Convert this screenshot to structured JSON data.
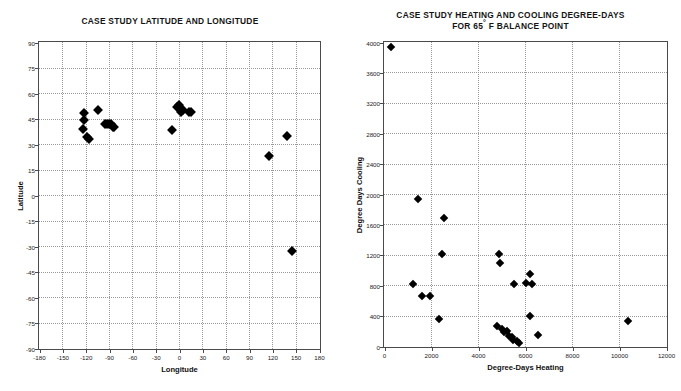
{
  "chart_data": [
    {
      "id": "latlon",
      "type": "scatter",
      "title": "CASE STUDY LATITUDE AND LONGITUDE",
      "xlabel": "Longitude",
      "ylabel": "Latitude",
      "xlim": [
        -180,
        180
      ],
      "ylim": [
        -90,
        90
      ],
      "xticks": [
        -180,
        -150,
        -120,
        -90,
        -60,
        -30,
        0,
        30,
        60,
        90,
        120,
        150,
        180
      ],
      "yticks": [
        -90,
        -75,
        -60,
        -45,
        -30,
        -15,
        0,
        15,
        30,
        45,
        60,
        75,
        90
      ],
      "grid": true,
      "legend": "none",
      "marker": "filled-diamond",
      "marker_color": "#000000",
      "points": [
        {
          "x": -122,
          "y": 48
        },
        {
          "x": -122,
          "y": 44
        },
        {
          "x": -123,
          "y": 39
        },
        {
          "x": -118,
          "y": 34
        },
        {
          "x": -116,
          "y": 33
        },
        {
          "x": -104,
          "y": 50
        },
        {
          "x": -95,
          "y": 42
        },
        {
          "x": -93,
          "y": 42
        },
        {
          "x": -90,
          "y": 42
        },
        {
          "x": -88,
          "y": 42
        },
        {
          "x": -85,
          "y": 40
        },
        {
          "x": -83,
          "y": 40
        },
        {
          "x": -3,
          "y": 52
        },
        {
          "x": 0,
          "y": 53
        },
        {
          "x": 2,
          "y": 49
        },
        {
          "x": 5,
          "y": 50
        },
        {
          "x": 13,
          "y": 49
        },
        {
          "x": 16,
          "y": 49
        },
        {
          "x": -9,
          "y": 38
        },
        {
          "x": 116,
          "y": 23
        },
        {
          "x": 139,
          "y": 35
        },
        {
          "x": 145,
          "y": -33
        }
      ]
    },
    {
      "id": "degreedays",
      "type": "scatter",
      "title_line1": "CASE STUDY HEATING AND COOLING DEGREE-DAYS",
      "title_line2_pre": "FOR 65",
      "title_line2_post": " F BALANCE POINT",
      "xlabel": "Degree-Days Heating",
      "ylabel": "Degree Days Cooling",
      "xlim": [
        0,
        12000
      ],
      "ylim": [
        0,
        4000
      ],
      "xticks": [
        0,
        2000,
        4000,
        6000,
        8000,
        10000,
        12000
      ],
      "yticks": [
        0,
        400,
        800,
        1200,
        1600,
        2000,
        2400,
        2800,
        3200,
        3600,
        4000
      ],
      "grid": true,
      "legend": "none",
      "marker": "filled-diamond",
      "marker_color": "#000000",
      "points": [
        {
          "x": 300,
          "y": 3940
        },
        {
          "x": 1450,
          "y": 1930
        },
        {
          "x": 2550,
          "y": 1680
        },
        {
          "x": 2350,
          "y": 350
        },
        {
          "x": 1250,
          "y": 820
        },
        {
          "x": 1600,
          "y": 660
        },
        {
          "x": 1950,
          "y": 660
        },
        {
          "x": 2450,
          "y": 1210
        },
        {
          "x": 4900,
          "y": 1210
        },
        {
          "x": 4950,
          "y": 1090
        },
        {
          "x": 5550,
          "y": 820
        },
        {
          "x": 6200,
          "y": 950
        },
        {
          "x": 6050,
          "y": 830
        },
        {
          "x": 6300,
          "y": 820
        },
        {
          "x": 6200,
          "y": 390
        },
        {
          "x": 4800,
          "y": 260
        },
        {
          "x": 5000,
          "y": 230
        },
        {
          "x": 5100,
          "y": 180
        },
        {
          "x": 5250,
          "y": 200
        },
        {
          "x": 5300,
          "y": 130
        },
        {
          "x": 5450,
          "y": 120
        },
        {
          "x": 5500,
          "y": 80
        },
        {
          "x": 5650,
          "y": 70
        },
        {
          "x": 5750,
          "y": 40
        },
        {
          "x": 6550,
          "y": 140
        },
        {
          "x": 10400,
          "y": 330
        }
      ]
    }
  ],
  "artifacts": {
    "faint_mark": ""
  }
}
